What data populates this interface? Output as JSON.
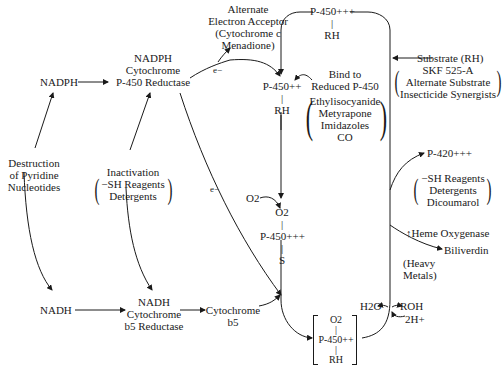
{
  "diagram": {
    "nodes": {
      "nadph": "NADPH",
      "nadph_reductase": [
        "NADPH",
        "Cytochrome",
        "P-450 Reductase"
      ],
      "alt_acceptor": [
        "Alternate",
        "Electron Acceptor",
        "(Cytochrome c",
        "Menadione)"
      ],
      "destruction": [
        "Destruction",
        "of Pyridine",
        "Nucleotides"
      ],
      "inactivation": [
        "Inactivation",
        "−SH Reagents",
        "Detergents"
      ],
      "nadh": "NADH",
      "nadh_reductase": [
        "NADH",
        "Cytochrome",
        "b5 Reductase"
      ],
      "cytochrome_b5": [
        "Cytochrome",
        "b5"
      ],
      "p450_ox_rh": [
        "P-450+++",
        "|",
        "RH"
      ],
      "p450_red_rh": [
        "P-450++",
        "|",
        "RH"
      ],
      "bind_reduced": [
        "Bind to",
        "Reduced P-450"
      ],
      "reduced_binders": [
        "Ethylisocyanide",
        "Metyrapone",
        "Imidazoles",
        "CO"
      ],
      "o2_in": "O2",
      "o2_complex": [
        "O2",
        "|",
        "P-450+++",
        "|",
        "S"
      ],
      "substrate": "Substrate (RH)",
      "substrate_inhibitors": [
        "SKF 525-A",
        "Alternate Substrate",
        "Insecticide Synergists"
      ],
      "p420": "P-420+++",
      "p420_causes": [
        "−SH Reagents",
        "Detergents",
        "Dicoumarol"
      ],
      "heme_oxygenase": "↑Heme Oxygenase",
      "biliverdin": "Biliverdin",
      "heavy_metals": [
        "(Heavy",
        "Metals)"
      ],
      "h2o": "H2O",
      "roh": "ROH",
      "two_h": "2H+",
      "final_complex": [
        "O2",
        "|",
        "P-450++",
        "|",
        "RH"
      ]
    },
    "edge_labels": {
      "e1": "e−",
      "e2": "e−"
    }
  }
}
